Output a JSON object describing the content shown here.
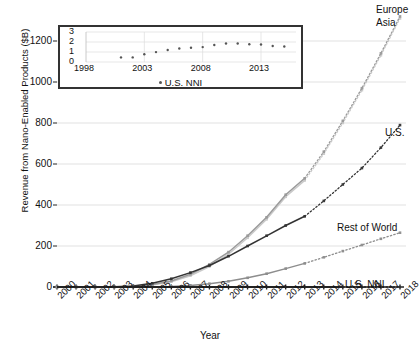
{
  "chart_data": {
    "type": "line",
    "title": "",
    "xlabel": "Year",
    "ylabel": "Revenue from Nano-Enabled Products ($B)",
    "xlim": [
      2000,
      2018
    ],
    "ylim": [
      0,
      1200
    ],
    "yticks": [
      0,
      200,
      400,
      600,
      800,
      1000,
      1200
    ],
    "xticks": [
      2000,
      2001,
      2002,
      2003,
      2004,
      2005,
      2006,
      2007,
      2008,
      2009,
      2010,
      2011,
      2012,
      2013,
      2014,
      2015,
      2016,
      2017,
      2018
    ],
    "grid": true,
    "legend_position": "right-of-line-ends",
    "x": [
      2000,
      2001,
      2002,
      2003,
      2004,
      2005,
      2006,
      2007,
      2008,
      2009,
      2010,
      2011,
      2012,
      2013,
      2014,
      2015,
      2016,
      2017,
      2018
    ],
    "series": [
      {
        "name": "Europe",
        "label": "Europe",
        "color": "#c9c9c9",
        "solid_through": 2013,
        "values": [
          0,
          0,
          0,
          0,
          2,
          10,
          26,
          55,
          100,
          160,
          240,
          330,
          440,
          520,
          650,
          800,
          960,
          1130,
          1310
        ]
      },
      {
        "name": "Asia",
        "label": "Asia",
        "color": "#9a9a9a",
        "solid_through": 2013,
        "values": [
          0,
          0,
          0,
          0,
          2,
          12,
          30,
          62,
          110,
          170,
          250,
          340,
          450,
          530,
          660,
          810,
          970,
          1140,
          1320
        ]
      },
      {
        "name": "U.S.",
        "label": "U.S.",
        "color": "#333333",
        "solid_through": 2013,
        "values": [
          0,
          0,
          0,
          1,
          5,
          18,
          40,
          70,
          105,
          150,
          200,
          250,
          300,
          345,
          420,
          500,
          580,
          680,
          790
        ]
      },
      {
        "name": "Rest of World",
        "label": "Rest of World",
        "color": "#8d8d8d",
        "solid_through": 2013,
        "values": [
          0,
          0,
          0,
          0,
          0,
          1,
          3,
          8,
          16,
          28,
          45,
          65,
          90,
          115,
          145,
          175,
          205,
          235,
          265
        ]
      },
      {
        "name": "U.S. NNI",
        "label": "U.S. NNI",
        "color": "#222222",
        "solid_through": 2015,
        "values": [
          0,
          0,
          0,
          0,
          0,
          0,
          0,
          0,
          0,
          0,
          0,
          0,
          0,
          0,
          0,
          0,
          0,
          0,
          0
        ]
      }
    ],
    "inset": {
      "type": "scatter",
      "xlabel": "",
      "ylabel": "",
      "legend": "U.S. NNI",
      "xlim": [
        1998,
        2016
      ],
      "ylim": [
        0,
        3
      ],
      "yticks": [
        0,
        1,
        2,
        3
      ],
      "xticks": [
        1998,
        2003,
        2008,
        2013
      ],
      "x": [
        2001,
        2002,
        2003,
        2004,
        2005,
        2006,
        2007,
        2008,
        2009,
        2010,
        2011,
        2012,
        2013,
        2014,
        2015
      ],
      "values": [
        0.46,
        0.46,
        0.77,
        0.99,
        1.2,
        1.35,
        1.42,
        1.49,
        1.7,
        1.85,
        1.85,
        1.78,
        1.75,
        1.6,
        1.55
      ]
    }
  }
}
